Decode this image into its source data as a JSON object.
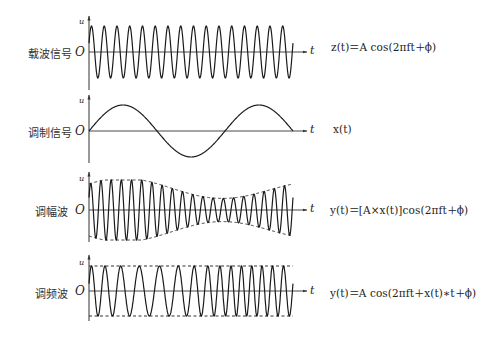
{
  "diagram": {
    "type": "signal-modulation-comparison",
    "axis_labels": {
      "y": "u",
      "x": "t",
      "origin": "O"
    },
    "rows": [
      {
        "id": "carrier",
        "label": "载波信号",
        "formula": "z(t)＝A cos(2πft＋ϕ)",
        "waveform": {
          "kind": "cosine",
          "cycles": 16,
          "amplitude": "constant",
          "envelope_dashed": false
        },
        "geometry": {
          "zero_y": 52,
          "amplitude_px": 26
        }
      },
      {
        "id": "modulating",
        "label": "调制信号",
        "formula": "x(t)",
        "waveform": {
          "kind": "sine",
          "cycles": 1.5,
          "amplitude": "constant",
          "envelope_dashed": false
        },
        "geometry": {
          "zero_y": 131,
          "amplitude_px": 26
        }
      },
      {
        "id": "am",
        "label": "调幅波",
        "formula": "y(t)＝[A×x(t)]cos(2πft＋ϕ)",
        "waveform": {
          "kind": "amplitude-modulated",
          "cycles": 20,
          "amplitude": "varies with x(t)",
          "envelope_dashed": true
        },
        "geometry": {
          "zero_y": 210,
          "amplitude_max_px": 30,
          "amplitude_min_px": 11
        }
      },
      {
        "id": "fm",
        "label": "调频波",
        "formula": "y(t)＝A cos(2πft＋x(t)∗t＋ϕ)",
        "waveform": {
          "kind": "frequency-modulated",
          "cycles": 15,
          "amplitude": "constant",
          "envelope_dashed": true
        },
        "geometry": {
          "zero_y": 291,
          "amplitude_px": 25
        }
      }
    ]
  },
  "colors": {
    "line": "#1a1a1a",
    "axis": "#333333",
    "background": "#ffffff"
  }
}
